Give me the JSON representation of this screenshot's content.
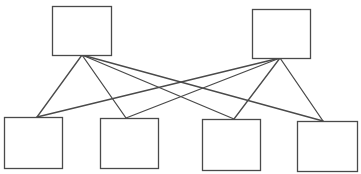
{
  "diagram": {
    "type": "bipartite-graph",
    "width": 361,
    "height": 174,
    "stroke_color": "#4a4a4a",
    "box_fill": "#ffffff",
    "stroke_width": 1.3,
    "nodes": [
      {
        "id": "top-left",
        "row": "top",
        "x": 52,
        "y": 6,
        "w": 59,
        "h": 49,
        "anchor": [
          82,
          55
        ]
      },
      {
        "id": "top-right",
        "row": "top",
        "x": 252,
        "y": 9,
        "w": 58,
        "h": 49,
        "anchor": [
          280,
          58
        ]
      },
      {
        "id": "bottom-1",
        "row": "bottom",
        "x": 4,
        "y": 117,
        "w": 58,
        "h": 51,
        "anchor": [
          37,
          117
        ]
      },
      {
        "id": "bottom-2",
        "row": "bottom",
        "x": 100,
        "y": 118,
        "w": 58,
        "h": 50,
        "anchor": [
          126,
          118
        ]
      },
      {
        "id": "bottom-3",
        "row": "bottom",
        "x": 202,
        "y": 119,
        "w": 58,
        "h": 51,
        "anchor": [
          234,
          119
        ]
      },
      {
        "id": "bottom-4",
        "row": "bottom",
        "x": 297,
        "y": 121,
        "w": 60,
        "h": 50,
        "anchor": [
          323,
          121
        ]
      }
    ],
    "edges": [
      {
        "from": "top-left",
        "to": "bottom-1"
      },
      {
        "from": "top-left",
        "to": "bottom-2"
      },
      {
        "from": "top-left",
        "to": "bottom-3"
      },
      {
        "from": "top-left",
        "to": "bottom-4"
      },
      {
        "from": "top-right",
        "to": "bottom-1"
      },
      {
        "from": "top-right",
        "to": "bottom-2"
      },
      {
        "from": "top-right",
        "to": "bottom-3"
      },
      {
        "from": "top-right",
        "to": "bottom-4"
      }
    ]
  }
}
